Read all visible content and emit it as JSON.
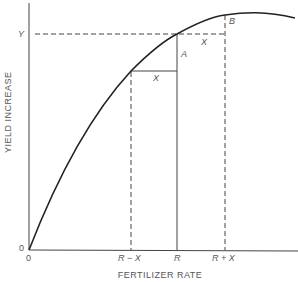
{
  "diagram": {
    "title": "",
    "axes": {
      "x_label": "FERTILIZER RATE",
      "y_label": "YIELD INCREASE",
      "origin_x_label": "0",
      "origin_y_label": "0"
    },
    "x_ticks": [
      "R − X",
      "R",
      "R + X"
    ],
    "y_ticks": [
      "Y"
    ],
    "annotations": {
      "A": "A",
      "B": "B",
      "X_lower": "X",
      "X_upper": "X"
    },
    "curve": "concave yield response curve rising from origin to a maximum beyond R + X",
    "colors": {
      "line": "#222222",
      "text": "#555555",
      "background": "#ffffff"
    }
  }
}
